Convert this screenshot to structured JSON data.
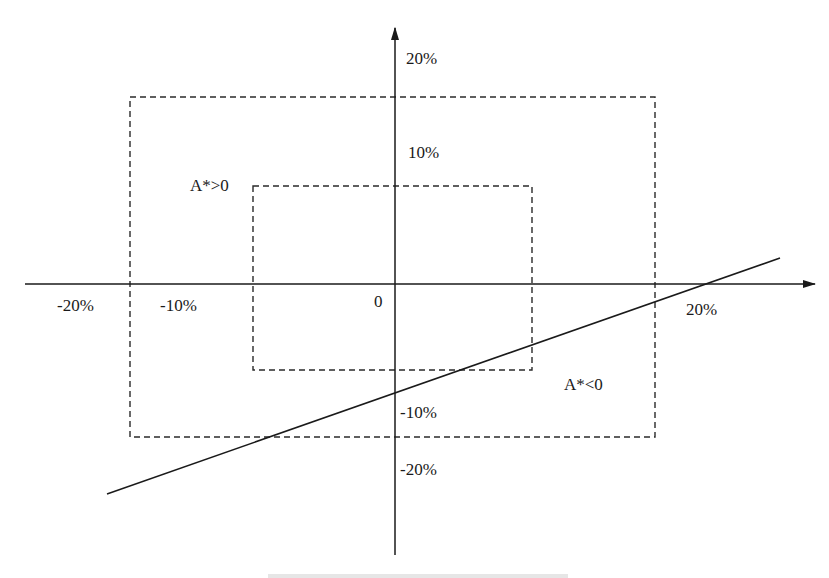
{
  "diagram": {
    "axes": {
      "x_tick_labels": [
        {
          "text": "-20%",
          "x": 57,
          "y": 297
        },
        {
          "text": "-10%",
          "x": 160,
          "y": 297
        },
        {
          "text": "0",
          "x": 374,
          "y": 293
        },
        {
          "text": "20%",
          "x": 686,
          "y": 301
        }
      ],
      "y_tick_labels": [
        {
          "text": "20%",
          "x": 406,
          "y": 50
        },
        {
          "text": "10%",
          "x": 408,
          "y": 144
        },
        {
          "text": "-10%",
          "x": 400,
          "y": 404
        },
        {
          "text": "-20%",
          "x": 400,
          "y": 461
        }
      ]
    },
    "region_labels": {
      "positive": {
        "text": "A*>0",
        "x": 190,
        "y": 177
      },
      "negative": {
        "text": "A*<0",
        "x": 564,
        "y": 376
      }
    },
    "colors": {
      "line": "#1a1a1a",
      "dash": "#2a2a2a",
      "background": "#ffffff"
    }
  }
}
